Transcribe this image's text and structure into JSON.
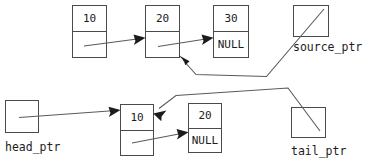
{
  "diagram": {
    "colors": {
      "background": "#ffffff",
      "box_stroke": "#4a4a4a",
      "line_stroke": "#5a5a5a",
      "text": "#1c1c1c"
    },
    "top_list": {
      "nodes": [
        {
          "value": "10",
          "next": ""
        },
        {
          "value": "20",
          "next": ""
        },
        {
          "value": "30",
          "next": "NULL"
        }
      ]
    },
    "bottom_list": {
      "nodes": [
        {
          "value": "10",
          "next": ""
        },
        {
          "value": "20",
          "next": "NULL"
        }
      ]
    },
    "pointers": [
      {
        "name": "source_ptr",
        "label": "source_ptr"
      },
      {
        "name": "head_ptr",
        "label": "head_ptr"
      },
      {
        "name": "tail_ptr",
        "label": "tail_ptr"
      }
    ],
    "labels": {
      "source_ptr": "source_ptr",
      "head_ptr": "head_ptr",
      "tail_ptr": "tail_ptr",
      "null_top": "NULL",
      "null_bottom": "NULL",
      "top_node1_value": "10",
      "top_node2_value": "20",
      "top_node3_value": "30",
      "bottom_node1_value": "10",
      "bottom_node2_value": "20"
    }
  }
}
